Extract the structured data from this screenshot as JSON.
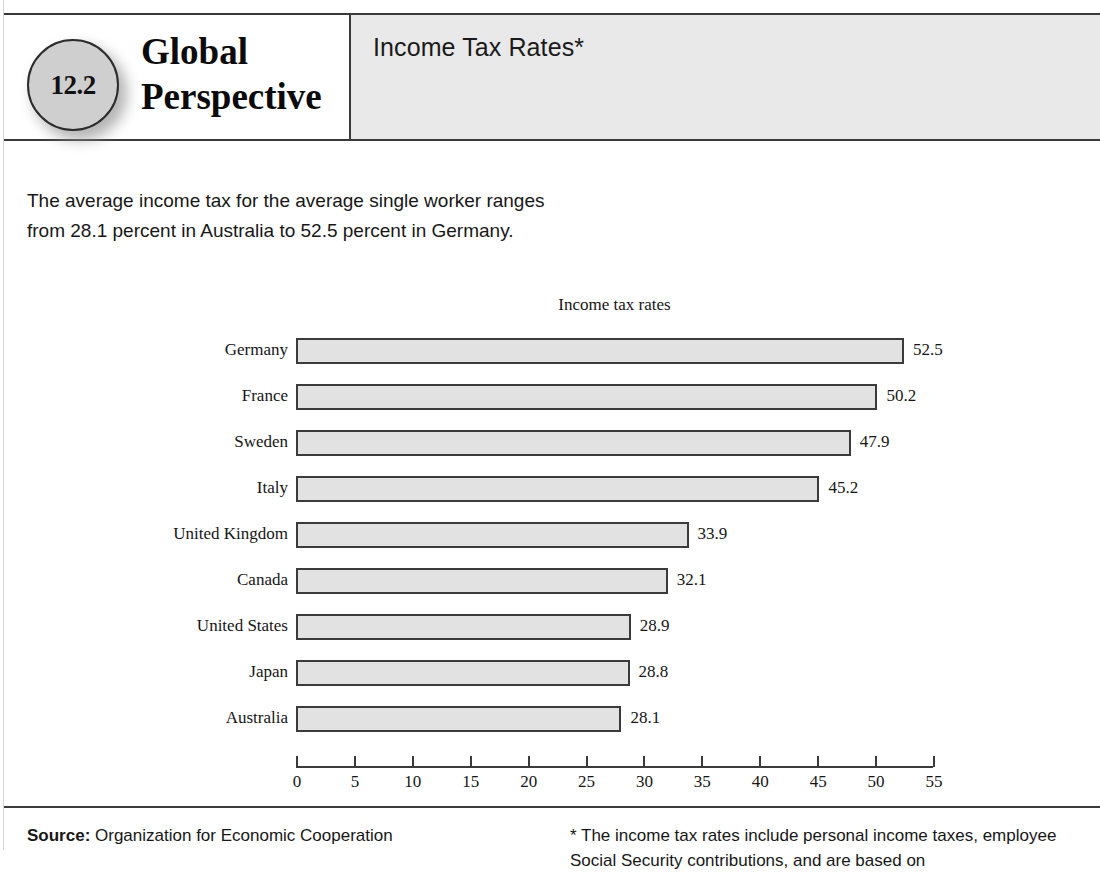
{
  "header": {
    "badge_number": "12.2",
    "brand_line1": "Global",
    "brand_line2": "Perspective",
    "title": "Income Tax Rates*"
  },
  "intro": {
    "text": "The average income tax for the average single worker ranges from 28.1 percent in Australia to 52.5 percent in Germany."
  },
  "footer": {
    "source_label": "Source:",
    "source_text": " Organization for Economic Cooperation",
    "note_line1": "* The income tax rates include personal income taxes,",
    "note_line2": "employee Social Security contributions, and are based on"
  },
  "chart_data": {
    "type": "bar",
    "orientation": "horizontal",
    "title": "Income tax rates",
    "xlabel": "",
    "ylabel": "",
    "xlim": [
      0,
      55
    ],
    "xticks": [
      0,
      5,
      10,
      15,
      20,
      25,
      30,
      35,
      40,
      45,
      50,
      55
    ],
    "grid": false,
    "legend": false,
    "bar_fill": "#e2e2e2",
    "bar_stroke": "#3b3b3b",
    "categories": [
      "Germany",
      "France",
      "Sweden",
      "Italy",
      "United Kingdom",
      "Canada",
      "United States",
      "Japan",
      "Australia"
    ],
    "values": [
      52.5,
      50.2,
      47.9,
      45.2,
      33.9,
      32.1,
      28.9,
      28.8,
      28.1
    ],
    "value_labels": [
      "52.5",
      "50.2",
      "47.9",
      "45.2",
      "33.9",
      "32.1",
      "28.9",
      "28.8",
      "28.1"
    ],
    "tick_labels": [
      "0",
      "5",
      "10",
      "15",
      "20",
      "25",
      "30",
      "35",
      "40",
      "45",
      "50",
      "55"
    ]
  }
}
